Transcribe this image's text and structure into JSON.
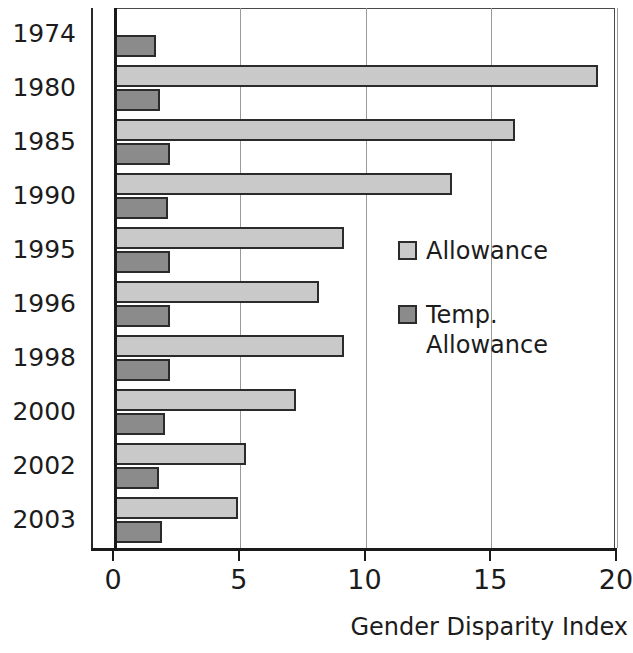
{
  "chart_data": {
    "type": "bar",
    "orientation": "horizontal",
    "title": "",
    "xlabel": "Gender Disparity Index",
    "ylabel": "",
    "xlim": [
      0,
      20
    ],
    "xticks": [
      0,
      5,
      10,
      15,
      20
    ],
    "xtick_labels": [
      "0",
      "5",
      "10",
      "15",
      "20"
    ],
    "grid": true,
    "grid_axis": "x",
    "legend_position": "inside-right",
    "categories": [
      "1974",
      "1980",
      "1985",
      "1990",
      "1995",
      "1996",
      "1998",
      "2000",
      "2002",
      "2003"
    ],
    "series": [
      {
        "name": "Allowance",
        "color": "#c9c9c9",
        "values": [
          0,
          19.2,
          15.9,
          13.4,
          9.1,
          8.1,
          9.1,
          7.2,
          5.2,
          4.9
        ]
      },
      {
        "name": "Temp. Allowance",
        "color": "#8b8b8b",
        "values": [
          1.65,
          1.8,
          2.2,
          2.1,
          2.2,
          2.2,
          2.2,
          2.0,
          1.75,
          1.85
        ]
      }
    ]
  },
  "legend": {
    "items": [
      {
        "label": "Allowance",
        "swatch": "allow"
      },
      {
        "label": "Temp.\nAllowance",
        "swatch": "temp"
      }
    ]
  },
  "axis": {
    "x_title": "Gender Disparity Index"
  }
}
